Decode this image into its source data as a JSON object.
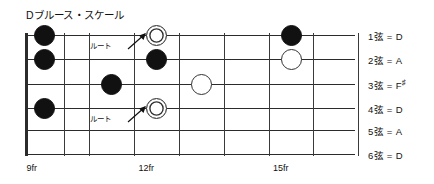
{
  "diagram": {
    "title": "Dブルース・スケール",
    "type": "guitar-fretboard-scale-diagram",
    "tuning_name": "Open D"
  },
  "fretboard": {
    "fret_count": 8,
    "string_count": 6,
    "fret_markers": [
      {
        "label": "9fr",
        "column": 0
      },
      {
        "label": "12fr",
        "column": 3
      },
      {
        "label": "15fr",
        "column": 6
      }
    ],
    "strings": [
      {
        "number": "1弦",
        "eq": "=",
        "note": "D",
        "accidental": ""
      },
      {
        "number": "2弦",
        "eq": "=",
        "note": "A",
        "accidental": ""
      },
      {
        "number": "3弦",
        "eq": "=",
        "note": "F",
        "accidental": "♯"
      },
      {
        "number": "4弦",
        "eq": "=",
        "note": "D",
        "accidental": ""
      },
      {
        "number": "5弦",
        "eq": "=",
        "note": "A",
        "accidental": ""
      },
      {
        "number": "6弦",
        "eq": "=",
        "note": "D",
        "accidental": ""
      }
    ],
    "notes": [
      {
        "string": 1,
        "fret_column": 0,
        "kind": "filled"
      },
      {
        "string": 2,
        "fret_column": 0,
        "kind": "filled"
      },
      {
        "string": 4,
        "fret_column": 0,
        "kind": "filled"
      },
      {
        "string": 3,
        "fret_column": 2,
        "kind": "filled"
      },
      {
        "string": 1,
        "fret_column": 3,
        "kind": "root"
      },
      {
        "string": 2,
        "fret_column": 3,
        "kind": "filled"
      },
      {
        "string": 4,
        "fret_column": 3,
        "kind": "root"
      },
      {
        "string": 3,
        "fret_column": 4,
        "kind": "hollow"
      },
      {
        "string": 1,
        "fret_column": 6,
        "kind": "filled"
      },
      {
        "string": 2,
        "fret_column": 6,
        "kind": "hollow"
      }
    ],
    "callouts": [
      {
        "label": "ルート",
        "target_string": 1,
        "target_fret_column": 3
      },
      {
        "label": "ルート",
        "target_string": 4,
        "target_fret_column": 3
      }
    ]
  },
  "colors": {
    "ink": "#111111",
    "line": "#2b2b2b",
    "fret": "#3a3a3a",
    "paper": "#ffffff"
  }
}
